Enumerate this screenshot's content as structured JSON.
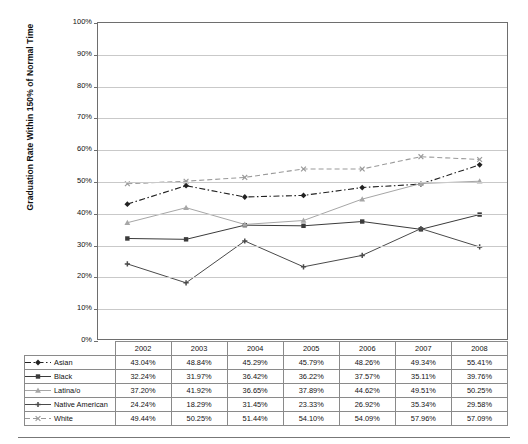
{
  "chart_data": {
    "type": "line",
    "title": "",
    "xlabel": "",
    "ylabel": "Graduation Rate Within 150% of Normal Time",
    "ylim": [
      0,
      100
    ],
    "ytick_labels": [
      "100%",
      "90%",
      "80%",
      "70%",
      "60%",
      "50%",
      "40%",
      "30%",
      "20%",
      "10%",
      "0%"
    ],
    "ytick_values": [
      100,
      90,
      80,
      70,
      60,
      50,
      40,
      30,
      20,
      10,
      0
    ],
    "grid": true,
    "legend_position": "table-left",
    "categories": [
      "2002",
      "2003",
      "2004",
      "2005",
      "2006",
      "2007",
      "2008"
    ],
    "series": [
      {
        "name": "Asian",
        "marker": "diamond",
        "line_style": "dash-dot",
        "color": "#222222",
        "values": [
          43.04,
          48.84,
          45.29,
          45.79,
          48.26,
          49.34,
          55.41
        ],
        "labels": [
          "43.04%",
          "48.84%",
          "45.29%",
          "45.79%",
          "48.26%",
          "49.34%",
          "55.41%"
        ]
      },
      {
        "name": "Black",
        "marker": "square",
        "line_style": "solid",
        "color": "#3b3b3b",
        "values": [
          32.24,
          31.97,
          36.42,
          36.22,
          37.57,
          35.11,
          39.76
        ],
        "labels": [
          "32.24%",
          "31.97%",
          "36.42%",
          "36.22%",
          "37.57%",
          "35.11%",
          "39.76%"
        ]
      },
      {
        "name": "Latina/o",
        "marker": "triangle",
        "line_style": "solid",
        "color": "#a6a6a6",
        "values": [
          37.2,
          41.92,
          36.65,
          37.89,
          44.62,
          49.51,
          50.25
        ],
        "labels": [
          "37.20%",
          "41.92%",
          "36.65%",
          "37.89%",
          "44.62%",
          "49.51%",
          "50.25%"
        ]
      },
      {
        "name": "Native American",
        "marker": "cross",
        "line_style": "solid",
        "color": "#4a4a4a",
        "values": [
          24.24,
          18.29,
          31.45,
          23.33,
          26.92,
          35.34,
          29.58
        ],
        "labels": [
          "24.24%",
          "18.29%",
          "31.45%",
          "23.33%",
          "26.92%",
          "35.34%",
          "29.58%"
        ]
      },
      {
        "name": "White",
        "marker": "x",
        "line_style": "dashed",
        "color": "#9a9a9a",
        "values": [
          49.44,
          50.25,
          51.44,
          54.1,
          54.09,
          57.96,
          57.09
        ],
        "labels": [
          "49.44%",
          "50.25%",
          "51.44%",
          "54.10%",
          "54.09%",
          "57.96%",
          "57.09%"
        ]
      }
    ]
  },
  "table": {
    "corner_header": "",
    "column_headers": [
      "2002",
      "2003",
      "2004",
      "2005",
      "2006",
      "2007",
      "2008"
    ],
    "rows": [
      {
        "label": "Asian",
        "values": [
          "43.04%",
          "48.84%",
          "45.29%",
          "45.79%",
          "48.26%",
          "49.34%",
          "55.41%"
        ]
      },
      {
        "label": "Black",
        "values": [
          "32.24%",
          "31.97%",
          "36.42%",
          "36.22%",
          "37.57%",
          "35.11%",
          "39.76%"
        ]
      },
      {
        "label": "Latina/o",
        "values": [
          "37.20%",
          "41.92%",
          "36.65%",
          "37.89%",
          "44.62%",
          "49.51%",
          "50.25%"
        ]
      },
      {
        "label": "Native American",
        "values": [
          "24.24%",
          "18.29%",
          "31.45%",
          "23.33%",
          "26.92%",
          "35.34%",
          "29.58%"
        ]
      },
      {
        "label": "White",
        "values": [
          "49.44%",
          "50.25%",
          "51.44%",
          "54.10%",
          "54.09%",
          "57.96%",
          "57.09%"
        ]
      }
    ]
  },
  "colors": {
    "axis": "#6e6e6e",
    "gridline": "#c9c9c9",
    "text": "#111111",
    "table_border": "#8a8a8a",
    "rule": "#777777"
  }
}
